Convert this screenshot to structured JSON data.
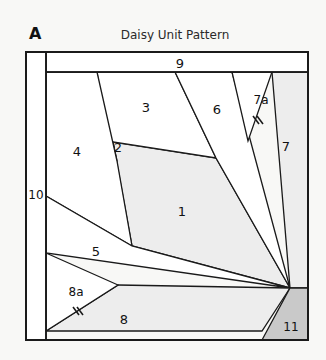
{
  "document": {
    "unit_letter": "A",
    "title": "Daisy Unit Pattern",
    "type": "foundation-paper-piecing-block-diagram"
  },
  "colors": {
    "page_background": "#f8f8f6",
    "block_fill_light": "#ffffff",
    "piece_fill_shaded": "#ededed",
    "piece_fill_dark": "#c9c9c9",
    "line": "#1a1a1a",
    "text": "#111111"
  },
  "block": {
    "outer_border": {
      "x": 26,
      "y": 52,
      "width": 282,
      "height": 288
    },
    "left_strip_divider_x": 46,
    "top_strip_divider_y": 72,
    "fan_apex": {
      "x": 290,
      "y": 288
    }
  },
  "pieces": [
    {
      "id": "1",
      "label": "1",
      "label_x": 182,
      "label_y": 212,
      "fill": "shaded",
      "points": "113,142 216,158 290,288 132,246"
    },
    {
      "id": "2",
      "label": "2",
      "label_x": 118,
      "label_y": 148,
      "fill": "light",
      "points": "107,138 113,142 117,161 104,160"
    },
    {
      "id": "3",
      "label": "3",
      "label_x": 146,
      "label_y": 108,
      "fill": "light",
      "points": "97,72 107,138 113,142 216,158 175,72"
    },
    {
      "id": "4",
      "label": "4",
      "label_x": 77,
      "label_y": 152,
      "fill": "light",
      "points": "46,72 97,72 117,161 132,246 46,196"
    },
    {
      "id": "5",
      "label": "5",
      "label_x": 96,
      "label_y": 252,
      "fill": "light",
      "points": "46,196 132,246 290,288 46,253"
    },
    {
      "id": "6",
      "label": "6",
      "label_x": 217,
      "label_y": 110,
      "fill": "light",
      "points": "175,72 232,72 290,288 216,158"
    },
    {
      "id": "7",
      "label": "7",
      "label_x": 286,
      "label_y": 147,
      "fill": "shaded",
      "points": "272,72 308,72 308,288 290,288"
    },
    {
      "id": "7a",
      "label": "7a",
      "label_x": 261,
      "label_y": 100,
      "fill": "light",
      "points": "232,72 272,72 248,141"
    },
    {
      "id": "8",
      "label": "8",
      "label_x": 124,
      "label_y": 320,
      "fill": "shaded",
      "points": "118,285 290,288 262,331 46,331"
    },
    {
      "id": "8a",
      "label": "8a",
      "label_x": 76,
      "label_y": 292,
      "fill": "light",
      "points": "46,253 118,285 46,331"
    },
    {
      "id": "9",
      "label": "9",
      "label_x": 180,
      "label_y": 64,
      "fill": "light",
      "points": "46,52 308,52 308,72 46,72"
    },
    {
      "id": "10",
      "label": "10",
      "label_x": 36,
      "label_y": 195,
      "fill": "light",
      "points": "26,52 46,52 46,340 26,340"
    },
    {
      "id": "11",
      "label": "11",
      "label_x": 291,
      "label_y": 327,
      "fill": "dark",
      "points": "290,288 308,288 308,340 262,340"
    }
  ],
  "seam_marks": [
    {
      "name": "tick-mark-7a",
      "x": 258,
      "y": 120,
      "count": 2
    },
    {
      "name": "tick-mark-8a",
      "x": 78,
      "y": 311,
      "count": 2
    }
  ]
}
